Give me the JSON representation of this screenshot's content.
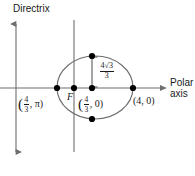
{
  "figure": {
    "background": "#ffffff",
    "stroke_color": "#6e6e6e",
    "text_color": "#1a1a1a",
    "point_color": "#000000"
  },
  "axes": {
    "vertical_axis": {
      "name": "directrix-axis",
      "label": "Directrix",
      "x": 16,
      "y_top": 18,
      "y_bottom": 158,
      "arrows": "both"
    },
    "directrix_line": {
      "name": "directrix-line",
      "x": 74,
      "y_top": 20,
      "y_bottom": 152,
      "arrows": "none"
    },
    "horizontal_axis": {
      "name": "polar-axis",
      "label_line_1": "Polar",
      "label_line_2": "axis",
      "y": 88,
      "x_left": 0,
      "x_right": 168,
      "arrows": "right"
    }
  },
  "conic": {
    "shape": "ellipse",
    "center_x": 95,
    "center_y": 87.5,
    "rx": 38,
    "ry": 31.5
  },
  "focus": {
    "label": "F",
    "x": 74,
    "y": 88
  },
  "points": [
    {
      "name": "vertex-left",
      "x": 57,
      "y": 88
    },
    {
      "name": "focus-point",
      "x": 74,
      "y": 88
    },
    {
      "name": "center-point",
      "x": 92,
      "y": 88
    },
    {
      "name": "vertex-right",
      "x": 133,
      "y": 88
    },
    {
      "name": "latus-rectum-top",
      "x": 92,
      "y": 56
    },
    {
      "name": "latus-rectum-bottom",
      "x": 92,
      "y": 119
    }
  ],
  "labels": {
    "vertex_left": {
      "open": "(",
      "num": "4",
      "den": "3",
      "rest": ", π)"
    },
    "vertex_center": {
      "open": "(",
      "num": "4",
      "den": "3",
      "rest": ", 0)"
    },
    "vertex_right": {
      "text": "(4, 0)"
    },
    "semi_latus_rectum": {
      "num": "4√3",
      "den": "3"
    }
  },
  "annotation_bracket": {
    "name": "semi-latus-rectum-bracket",
    "x": 92,
    "y_top": 56,
    "y_bottom": 88,
    "tick_length": 5
  }
}
